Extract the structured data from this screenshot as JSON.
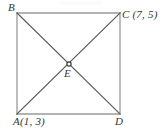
{
  "figure": {
    "type": "geometry-diagram",
    "background_color": "#ffffff",
    "edge_color": "#999999",
    "diagonal_color": "#555555",
    "label_color": "#333333",
    "square": {
      "corners": [
        {
          "id": "B",
          "label": "B",
          "x": 17,
          "y": 13,
          "position": "top-left"
        },
        {
          "id": "C",
          "label": "C (7, 5)",
          "x": 120,
          "y": 13,
          "position": "top-right"
        },
        {
          "id": "D",
          "label": "D",
          "x": 120,
          "y": 114,
          "position": "bottom-right"
        },
        {
          "id": "A",
          "label": "A(1, 3)",
          "x": 17,
          "y": 114,
          "position": "bottom-left"
        }
      ],
      "edges": [
        {
          "name": "BC",
          "from": "B",
          "to": "C"
        },
        {
          "name": "CD",
          "from": "C",
          "to": "D"
        },
        {
          "name": "DA",
          "from": "D",
          "to": "A"
        },
        {
          "name": "AB",
          "from": "A",
          "to": "B"
        }
      ],
      "diagonals": [
        {
          "name": "AC",
          "from": "A",
          "to": "C"
        },
        {
          "name": "BD",
          "from": "B",
          "to": "D"
        }
      ]
    },
    "intersection": {
      "id": "E",
      "label": "E",
      "x": 69,
      "y": 64,
      "marker": "dot"
    },
    "labels": {
      "b": "B",
      "c": "C (7, 5)",
      "a": "A(1, 3)",
      "d": "D",
      "e": "E"
    }
  }
}
